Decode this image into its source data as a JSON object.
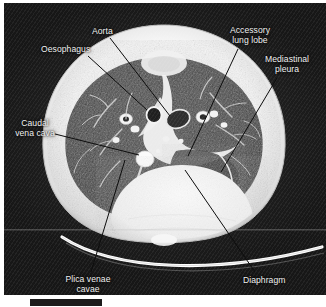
{
  "figure": {
    "modality": "CT",
    "view": "transverse (axial) lung window",
    "background_color": "#171717",
    "label_color": "#f2f2f2",
    "leader_color": "#111111"
  },
  "labels": [
    {
      "id": "oesophagus",
      "text": "Oesophagus",
      "lines": [
        "Oesophagus"
      ],
      "x": 41,
      "y": 44,
      "align": "left",
      "leader": {
        "x1": 88,
        "y1": 56,
        "x2": 147,
        "y2": 110
      }
    },
    {
      "id": "aorta",
      "text": "Aorta",
      "lines": [
        "Aorta"
      ],
      "x": 92,
      "y": 26,
      "align": "left",
      "leader": {
        "x1": 110,
        "y1": 38,
        "x2": 170,
        "y2": 116
      }
    },
    {
      "id": "accessory-lung-lobe",
      "text": "Accessory lung lobe",
      "lines": [
        "Accessory",
        "lung lobe"
      ],
      "x": 227,
      "y": 25,
      "align": "center",
      "leader": {
        "x1": 238,
        "y1": 49,
        "x2": 188,
        "y2": 156
      }
    },
    {
      "id": "mediastinal-pleura",
      "text": "Mediastinal pleura",
      "lines": [
        "Mediastinal",
        "pleura"
      ],
      "x": 263,
      "y": 54,
      "align": "center",
      "leader": {
        "x1": 277,
        "y1": 78,
        "x2": 221,
        "y2": 172
      }
    },
    {
      "id": "caudal-vena-cava",
      "text": "Caudal vena cava",
      "lines": [
        "Caudal",
        "vena cava"
      ],
      "x": 14,
      "y": 118,
      "align": "center",
      "leader": {
        "x1": 55,
        "y1": 134,
        "x2": 139,
        "y2": 155
      }
    },
    {
      "id": "plica-venae-cavae",
      "text": "Plica venae cavae",
      "lines": [
        "Plica venae",
        "cavae"
      ],
      "x": 61,
      "y": 274,
      "align": "center",
      "leader": {
        "x1": 91,
        "y1": 272,
        "x2": 125,
        "y2": 160
      }
    },
    {
      "id": "diaphragm",
      "text": "Diaphragm",
      "lines": [
        "Diaphragm"
      ],
      "x": 243,
      "y": 275,
      "align": "left",
      "leader": {
        "x1": 255,
        "y1": 272,
        "x2": 185,
        "y2": 170
      }
    }
  ],
  "structures": [
    {
      "id": "body-wall",
      "name": "thoracic body wall"
    },
    {
      "id": "left-lung-field",
      "name": "left lung field"
    },
    {
      "id": "right-lung-field",
      "name": "right lung field"
    },
    {
      "id": "mediastinum",
      "name": "mediastinum"
    },
    {
      "id": "diaphragm-dome",
      "name": "diaphragmatic dome"
    },
    {
      "id": "scanner-couch",
      "name": "scanner couch"
    },
    {
      "id": "vertebra",
      "name": "vertebral body"
    }
  ],
  "caption": {
    "badge": "",
    "text": ""
  }
}
